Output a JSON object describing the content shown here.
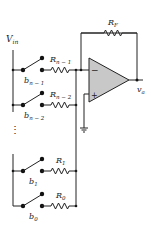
{
  "diagram": {
    "input_label": "V",
    "input_sub": "in",
    "output_label": "v",
    "output_sub": "a",
    "feedback": {
      "label": "R",
      "sub": "F"
    },
    "opamp": {
      "minus_symbol": "−",
      "plus_symbol": "+",
      "fill": "#c8c8c8"
    },
    "ellipsis": "⋮",
    "branches": [
      {
        "resistor": "R",
        "resistor_sub": "n − 1",
        "bit": "b",
        "bit_sub": "n − 1"
      },
      {
        "resistor": "R",
        "resistor_sub": "n − 2",
        "bit": "b",
        "bit_sub": "n − 2"
      },
      {
        "resistor": "R",
        "resistor_sub": "1",
        "bit": "b",
        "bit_sub": "1"
      },
      {
        "resistor": "R",
        "resistor_sub": "0",
        "bit": "b",
        "bit_sub": "0"
      }
    ],
    "colors": {
      "line": "#222222",
      "opamp_fill": "#c8c8c8",
      "background": "#ffffff"
    }
  }
}
